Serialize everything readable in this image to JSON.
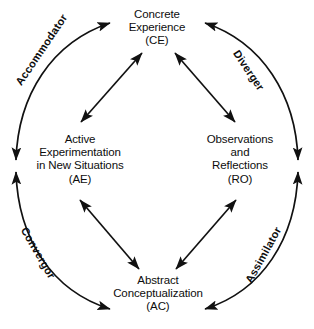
{
  "diagram": {
    "background_color": "#ffffff",
    "stroke_color": "#111111",
    "text_color": "#0d0d0d",
    "nodes": [
      {
        "id": "ce",
        "position": "top",
        "name": "concrete-experience",
        "lines": [
          "Concrete",
          "Experience",
          "(CE)"
        ],
        "line1": "Concrete",
        "line2": "Experience",
        "line3": "(CE)",
        "abbreviation": "CE"
      },
      {
        "id": "ae",
        "position": "left",
        "name": "active-experimentation",
        "lines": [
          "Active",
          "Experimentation",
          "in New Situations",
          "(AE)"
        ],
        "line1": "Active",
        "line2": "Experimentation",
        "line3": "in New Situations",
        "line4": "(AE)",
        "abbreviation": "AE"
      },
      {
        "id": "ro",
        "position": "right",
        "name": "observations-and-reflections",
        "lines": [
          "Observations",
          "and",
          "Reflections",
          "(RO)"
        ],
        "line1": "Observations",
        "line2": "and",
        "line3": "Reflections",
        "line4": "(RO)",
        "abbreviation": "RO"
      },
      {
        "id": "ac",
        "position": "bottom",
        "name": "abstract-conceptualization",
        "lines": [
          "Abstract",
          "Conceptualization",
          "(AC)"
        ],
        "line1": "Abstract",
        "line2": "Conceptualization",
        "line3": "(AC)",
        "abbreviation": "AC"
      }
    ],
    "learning_styles": [
      {
        "id": "accommodator",
        "label": "Accommodator",
        "quadrant": "top-left",
        "between": [
          "AE",
          "CE"
        ],
        "rotation_deg": -56
      },
      {
        "id": "diverger",
        "label": "Diverger",
        "quadrant": "top-right",
        "between": [
          "CE",
          "RO"
        ],
        "rotation_deg": 56
      },
      {
        "id": "convergor",
        "label": "Convergor",
        "quadrant": "bottom-left",
        "between": [
          "AC",
          "AE"
        ],
        "rotation_deg": 60
      },
      {
        "id": "assimilator",
        "label": "Assimilator",
        "quadrant": "bottom-right",
        "between": [
          "RO",
          "AC"
        ],
        "rotation_deg": -61
      }
    ],
    "inner_connectors": [
      {
        "id": "ce-ae",
        "from": "CE",
        "to": "AE",
        "heads": "both"
      },
      {
        "id": "ce-ro",
        "from": "CE",
        "to": "RO",
        "heads": "both"
      },
      {
        "id": "ae-ac",
        "from": "AE",
        "to": "AC",
        "heads": "both"
      },
      {
        "id": "ro-ac",
        "from": "RO",
        "to": "AC",
        "heads": "both"
      }
    ],
    "outer_arcs": [
      {
        "id": "arc-accommodator",
        "heads": "both"
      },
      {
        "id": "arc-diverger",
        "heads": "both"
      },
      {
        "id": "arc-convergor",
        "heads": "both"
      },
      {
        "id": "arc-assimilator",
        "heads": "both"
      }
    ]
  }
}
